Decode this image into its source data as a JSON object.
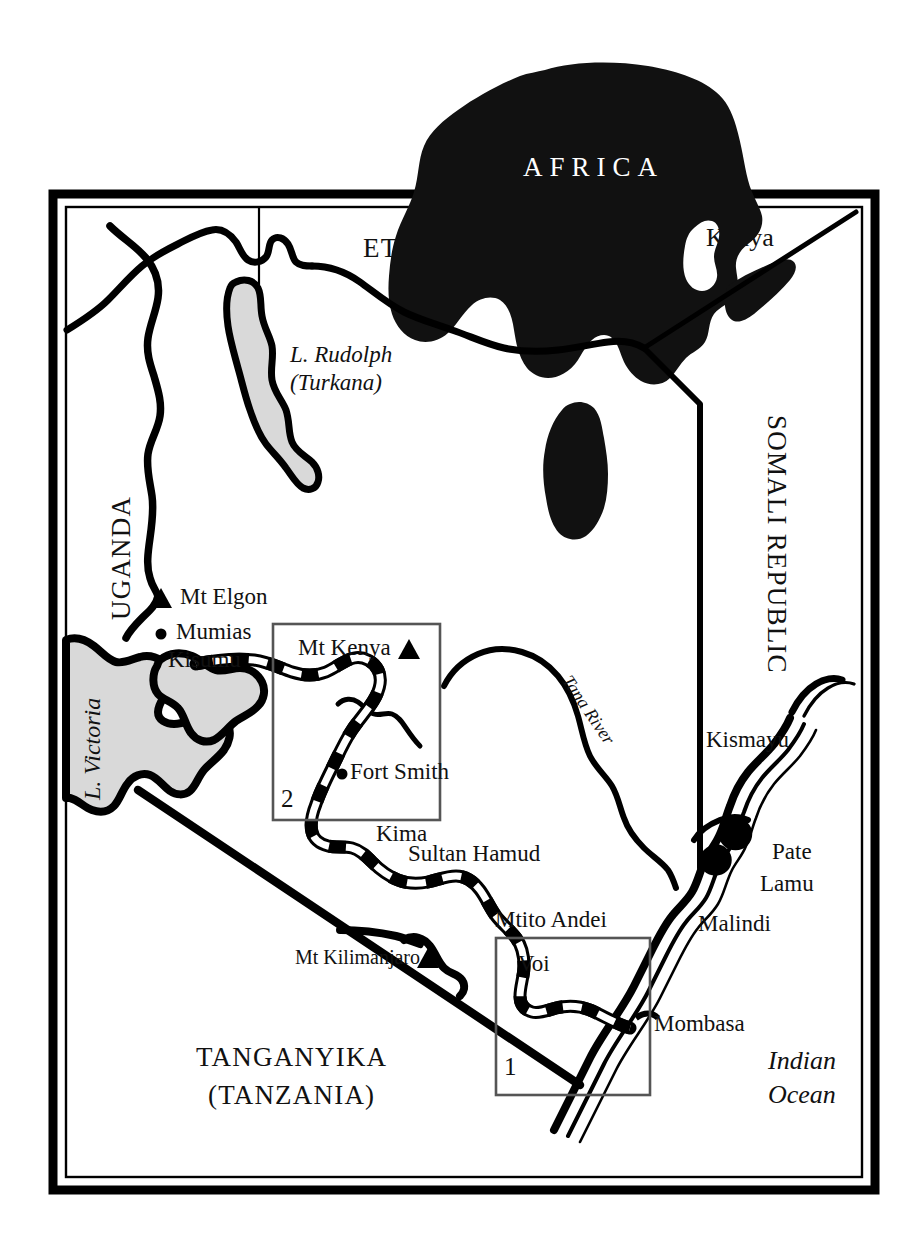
{
  "map": {
    "title": "Map of Kenya with railway line and inset detail boxes",
    "inset_continent_label": "AFRICA",
    "inset_country_label": "Kenya",
    "frame": {
      "outer_color": "#000000",
      "fill": "#ffffff"
    },
    "colors": {
      "ink": "#000000",
      "lake_fill": "#d9d9d9",
      "land_fill": "#ffffff",
      "continent_fill": "#111111",
      "box_stroke": "#555555"
    },
    "countries": [
      {
        "name": "ETHIOPIA",
        "style": "caps"
      },
      {
        "name": "UGANDA",
        "style": "caps-rotated-ccw"
      },
      {
        "name": "SOMALI REPUBLIC",
        "style": "caps-rotated-cw"
      },
      {
        "name": "TANGANYIKA",
        "style": "caps"
      },
      {
        "name": "(TANZANIA)",
        "style": "caps"
      }
    ],
    "water": [
      {
        "name": "L. Rudolph",
        "name2": "(Turkana)",
        "style": "italic"
      },
      {
        "name": "L. Victoria",
        "style": "italic-rotated"
      },
      {
        "name": "Tana River",
        "style": "italic-angled"
      },
      {
        "name": "Indian",
        "name2": "Ocean",
        "style": "italic"
      }
    ],
    "mountains": [
      {
        "name": "Mt Elgon",
        "marker": "triangle",
        "marker_side": "left"
      },
      {
        "name": "Mt Kenya",
        "marker": "triangle",
        "marker_side": "right"
      },
      {
        "name": "Mt Kilimanjaro",
        "marker": "triangle",
        "marker_side": "right"
      }
    ],
    "towns": [
      {
        "name": "Mumias",
        "marker": "dot"
      },
      {
        "name": "Kisumu",
        "marker": "none"
      },
      {
        "name": "Fort Smith",
        "marker": "dot"
      },
      {
        "name": "Kima",
        "marker": "none"
      },
      {
        "name": "Sultan Hamud",
        "marker": "none"
      },
      {
        "name": "Mtito Andei",
        "marker": "none"
      },
      {
        "name": "Voi",
        "marker": "none"
      },
      {
        "name": "Mombasa",
        "marker": "none"
      },
      {
        "name": "Malindi",
        "marker": "none"
      },
      {
        "name": "Lamu",
        "marker": "none"
      },
      {
        "name": "Pate",
        "marker": "none"
      },
      {
        "name": "Kismayu",
        "marker": "none"
      }
    ],
    "inset_boxes": [
      {
        "number": "1",
        "contains": [
          "Voi"
        ]
      },
      {
        "number": "2",
        "contains": [
          "Mt Kenya",
          "Fort Smith"
        ]
      }
    ],
    "legend_symbols": {
      "railway": "dashed black-and-white line",
      "mountain": "▲",
      "town": "●"
    }
  }
}
